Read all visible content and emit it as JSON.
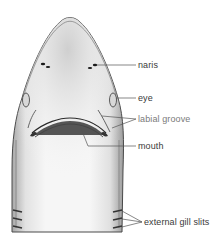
{
  "figure": {
    "colors": {
      "background": "#ffffff",
      "outline": "#4a4a4a",
      "shading": "#9a9a9a",
      "leader_line": "#555555",
      "label_text": "#3a3a3a",
      "label_text_light": "#7a7a7a"
    }
  },
  "labels": [
    {
      "id": "naris",
      "text": "naris"
    },
    {
      "id": "eye",
      "text": "eye"
    },
    {
      "id": "labial-groove",
      "text": "labial groove"
    },
    {
      "id": "mouth",
      "text": "mouth"
    },
    {
      "id": "external-gill-slits",
      "text": "external gill slits"
    }
  ]
}
